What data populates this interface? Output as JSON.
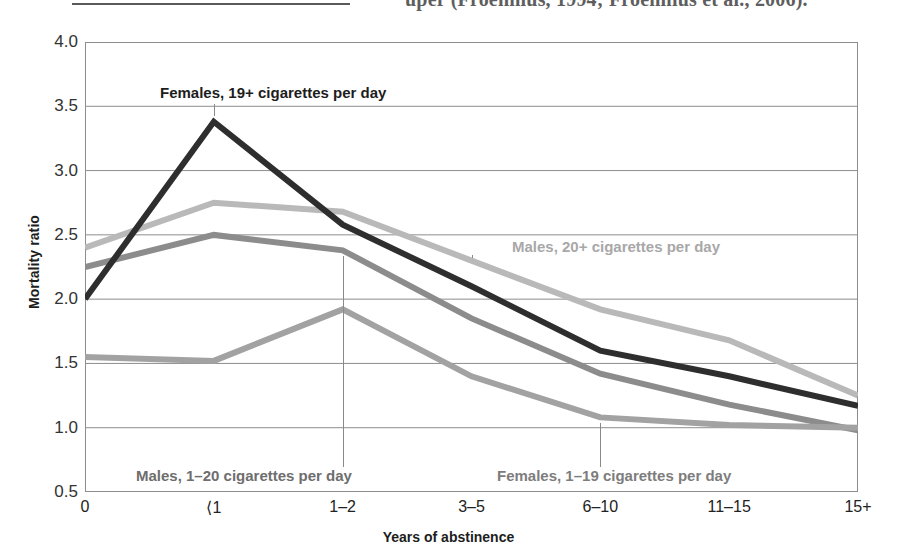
{
  "page_scrap": {
    "text": "uper (Froenhius, 1994; Froenhius et al., 2006)."
  },
  "chart_data": {
    "type": "line",
    "title": "",
    "xlabel": "Years of abstinence",
    "ylabel": "Mortality ratio",
    "categories": [
      "0",
      "⟨1",
      "1–2",
      "3–5",
      "6–10",
      "11–15",
      "15+"
    ],
    "ylim": [
      0.5,
      4.0
    ],
    "yticks": [
      "0.5",
      "1.0",
      "1.5",
      "2.0",
      "2.5",
      "3.0",
      "3.5",
      "4.0"
    ],
    "ytick_values": [
      0.5,
      1.0,
      1.5,
      2.0,
      2.5,
      3.0,
      3.5,
      4.0
    ],
    "grid": true,
    "legend_position": "annotations",
    "series": [
      {
        "name": "Females, 19+ cigarettes per day",
        "color": "#2e2e2e",
        "values": [
          2.0,
          3.38,
          2.58,
          2.1,
          1.6,
          1.4,
          1.17
        ]
      },
      {
        "name": "Males, 20+ cigarettes per day",
        "color": "#b9b9b9",
        "values": [
          2.4,
          2.75,
          2.68,
          2.3,
          1.92,
          1.68,
          1.25
        ]
      },
      {
        "name": "Males, 1–20 cigarettes per day",
        "color": "#8c8c8c",
        "values": [
          2.25,
          2.5,
          2.38,
          1.85,
          1.42,
          1.18,
          0.98
        ]
      },
      {
        "name": "Females, 1–19 cigarettes per day",
        "color": "#a2a2a2",
        "values": [
          1.55,
          1.52,
          1.92,
          1.4,
          1.08,
          1.02,
          1.0
        ]
      }
    ],
    "annotations": [
      {
        "label": "Females, 19+ cigarettes per day",
        "color": "#1d1d1d"
      },
      {
        "label": "Males, 20+ cigarettes per day",
        "color": "#a8a8a8"
      },
      {
        "label": "Males, 1–20 cigarettes per day",
        "color": "#6e6e6e"
      },
      {
        "label": "Females, 1–19 cigarettes per day",
        "color": "#7d7d7d"
      }
    ]
  }
}
